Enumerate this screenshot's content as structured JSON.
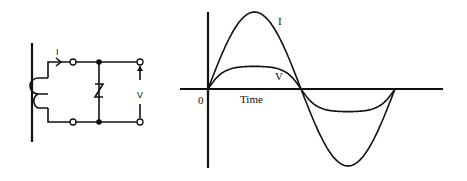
{
  "circuit": {
    "current_label": "I",
    "voltage_label": "V",
    "components": [
      "current-transformer",
      "zener-diode",
      "output-terminals"
    ]
  },
  "waveform": {
    "origin_label": "0",
    "x_axis_label": "Time",
    "curves": [
      {
        "name": "I",
        "label": "I",
        "shape": "sine"
      },
      {
        "name": "V",
        "label": "V",
        "shape": "clipped-sine"
      }
    ]
  }
}
